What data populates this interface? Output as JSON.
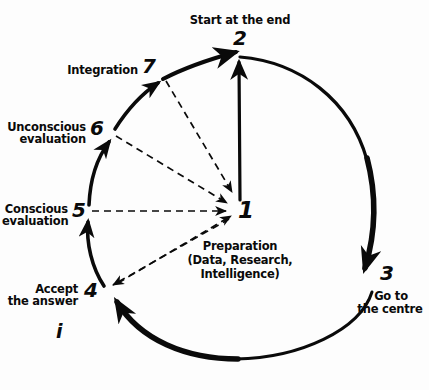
{
  "diagram": {
    "title_note": "Seven-step decision cycle, hand-drawn",
    "background_color": "#fdfdfd",
    "ink_color": "#0a0a0a",
    "center": {
      "number": "1",
      "caption_line1": "Preparation",
      "caption_line2": "(Data, Research,",
      "caption_line3": "Intelligence)"
    },
    "stray_mark": "i",
    "nodes": [
      {
        "id": "node-2",
        "number": "2",
        "label": "Start at the end",
        "label_lines": [
          "Start at the end"
        ],
        "position": "top"
      },
      {
        "id": "node-3",
        "number": "3",
        "label": "Go to the centre",
        "label_lines": [
          "Go to",
          "the centre"
        ],
        "position": "right"
      },
      {
        "id": "node-4",
        "number": "4",
        "label": "Accept the answer",
        "label_lines": [
          "Accept",
          "the answer"
        ],
        "position": "lower-left"
      },
      {
        "id": "node-5",
        "number": "5",
        "label": "Conscious evaluation",
        "label_lines": [
          "Conscious",
          "evaluation"
        ],
        "position": "left"
      },
      {
        "id": "node-6",
        "number": "6",
        "label": "Unconscious evaluation",
        "label_lines": [
          "Unconscious",
          "evaluation"
        ],
        "position": "upper-left"
      },
      {
        "id": "node-7",
        "number": "7",
        "label": "Integration",
        "label_lines": [
          "Integration"
        ],
        "position": "top-left"
      }
    ],
    "connections": [
      {
        "id": "arrow-1-to-2",
        "from": "1",
        "to": "2",
        "style": "solid",
        "kind": "straight"
      },
      {
        "id": "arc-2-to-3",
        "from": "2",
        "to": "3",
        "style": "solid",
        "kind": "arc"
      },
      {
        "id": "arc-3-to-4",
        "from": "3",
        "to": "4",
        "style": "solid",
        "kind": "arc"
      },
      {
        "id": "arc-4-to-5",
        "from": "4",
        "to": "5",
        "style": "solid",
        "kind": "arc"
      },
      {
        "id": "arc-5-to-6",
        "from": "5",
        "to": "6",
        "style": "solid",
        "kind": "arc"
      },
      {
        "id": "arc-6-to-7",
        "from": "6",
        "to": "7",
        "style": "solid",
        "kind": "arc"
      },
      {
        "id": "arc-7-to-2",
        "from": "7",
        "to": "2",
        "style": "solid",
        "kind": "arc"
      },
      {
        "id": "dashed-1-to-4",
        "from": "1",
        "to": "4",
        "style": "dashed",
        "kind": "spoke"
      },
      {
        "id": "dashed-5-to-1",
        "from": "5",
        "to": "1",
        "style": "dashed",
        "kind": "spoke"
      },
      {
        "id": "dashed-6-to-1",
        "from": "6",
        "to": "1",
        "style": "dashed",
        "kind": "spoke"
      },
      {
        "id": "dashed-7-to-1",
        "from": "7",
        "to": "1",
        "style": "dashed",
        "kind": "spoke"
      }
    ]
  }
}
